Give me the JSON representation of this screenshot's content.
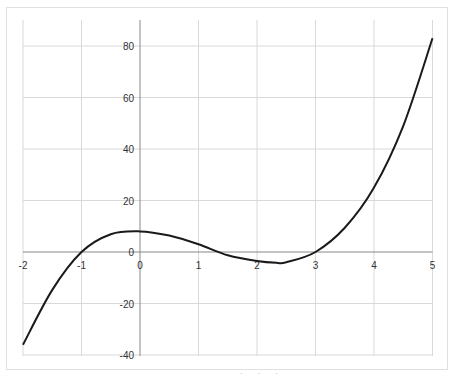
{
  "chart_data": {
    "type": "line",
    "title": "",
    "xlabel": "",
    "ylabel": "",
    "xlim": [
      -2,
      5
    ],
    "ylim": [
      -40,
      90
    ],
    "grid": true,
    "legend": null,
    "x_ticks": [
      "-2",
      "-1",
      "0",
      "1",
      "2",
      "3",
      "4",
      "5"
    ],
    "y_ticks": [
      "80",
      "60",
      "40",
      "20",
      "0",
      "-20",
      "-40"
    ],
    "series": [
      {
        "name": "f(x)",
        "x": [
          -2,
          -1.5,
          -1,
          -0.5,
          0,
          0.5,
          1,
          1.5,
          2,
          2.33,
          2.5,
          3,
          3.5,
          4,
          4.5,
          5
        ],
        "y": [
          -36,
          -14.7,
          0,
          6.9,
          8,
          6.4,
          3,
          -1.3,
          -3.5,
          -4.2,
          -4.0,
          0,
          9.4,
          25,
          49,
          83
        ]
      }
    ],
    "line_color": "#1a1a1a",
    "grid_color": "#d9d9d9",
    "axis_color": "#888888"
  },
  "footer": {
    "partial_text": "· · ·"
  }
}
